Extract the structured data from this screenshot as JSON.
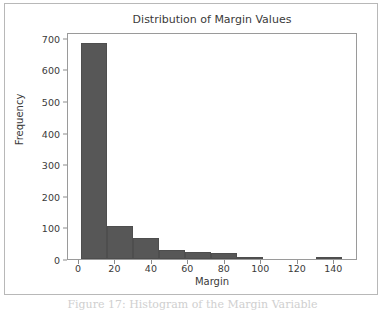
{
  "figure": {
    "caption": "Figure 17: Histogram of the Margin Variable"
  },
  "chart_data": {
    "type": "bar",
    "title": "Distribution of Margin Values",
    "xlabel": "Margin",
    "ylabel": "Frequency",
    "xlim": [
      -6.0,
      153.0
    ],
    "ylim": [
      0,
      718
    ],
    "grid": false,
    "legend": null,
    "bar_color": "#575757",
    "bin_edges": [
      1.0,
      15.3,
      29.6,
      43.9,
      58.2,
      72.5,
      86.8,
      101.1,
      115.4,
      129.7,
      144.0
    ],
    "bin_width": 14.3,
    "categories": [
      "1.0-15.3",
      "15.3-29.6",
      "29.6-43.9",
      "43.9-58.2",
      "58.2-72.5",
      "72.5-86.8",
      "86.8-101.1",
      "101.1-115.4",
      "115.4-129.7",
      "129.7-144.0"
    ],
    "values": [
      683,
      105,
      68,
      29,
      21,
      19,
      7,
      0,
      0,
      4
    ],
    "xticks": [
      0,
      20,
      40,
      60,
      80,
      100,
      120,
      140
    ],
    "xtick_labels": [
      "0",
      "20",
      "40",
      "60",
      "80",
      "100",
      "120",
      "140"
    ],
    "yticks": [
      0,
      100,
      200,
      300,
      400,
      500,
      600,
      700
    ],
    "ytick_labels": [
      "0",
      "100",
      "200",
      "300",
      "400",
      "500",
      "600",
      "700"
    ]
  }
}
